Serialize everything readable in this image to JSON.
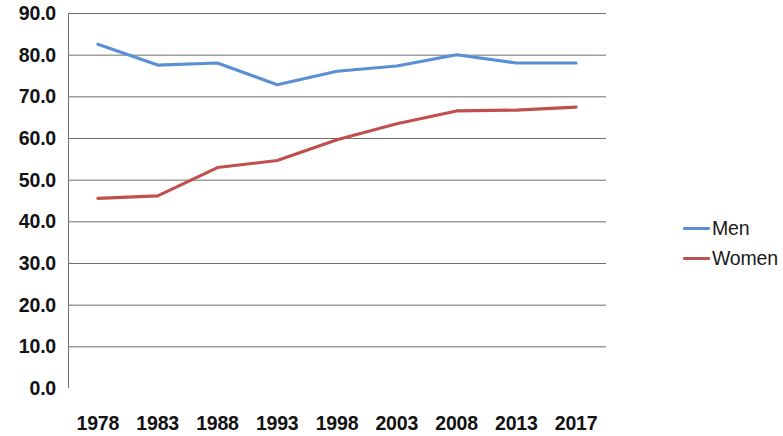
{
  "chart_data": {
    "type": "line",
    "title": "",
    "subtitle": "",
    "xlabel": "",
    "ylabel": "",
    "categories": [
      "1978",
      "1983",
      "1988",
      "1993",
      "1998",
      "2003",
      "2008",
      "2013",
      "2017"
    ],
    "series": [
      {
        "name": "Men",
        "color": "#5b8fd4",
        "values": [
          82.5,
          77.5,
          78.0,
          72.8,
          76.0,
          77.3,
          80.0,
          78.0,
          78.0
        ]
      },
      {
        "name": "Women",
        "color": "#c0504d",
        "values": [
          45.5,
          46.1,
          52.9,
          54.6,
          59.6,
          63.4,
          66.5,
          66.7,
          67.4
        ]
      }
    ],
    "ylim": [
      0,
      90
    ],
    "ytick_labels": [
      "0.0",
      "10.0",
      "20.0",
      "30.0",
      "40.0",
      "50.0",
      "60.0",
      "70.0",
      "80.0",
      "90.0"
    ],
    "ytick_values": [
      0,
      10,
      20,
      30,
      40,
      50,
      60,
      70,
      80,
      90
    ],
    "grid": true,
    "grid_axis": "y",
    "grid_color": "#6e6e6e",
    "axis_color": "#6e6e6e",
    "legend_position": "right",
    "markers": false
  },
  "legend": {
    "entries": [
      {
        "label": "Men",
        "color": "#5b8fd4"
      },
      {
        "label": "Women",
        "color": "#c0504d"
      }
    ]
  }
}
